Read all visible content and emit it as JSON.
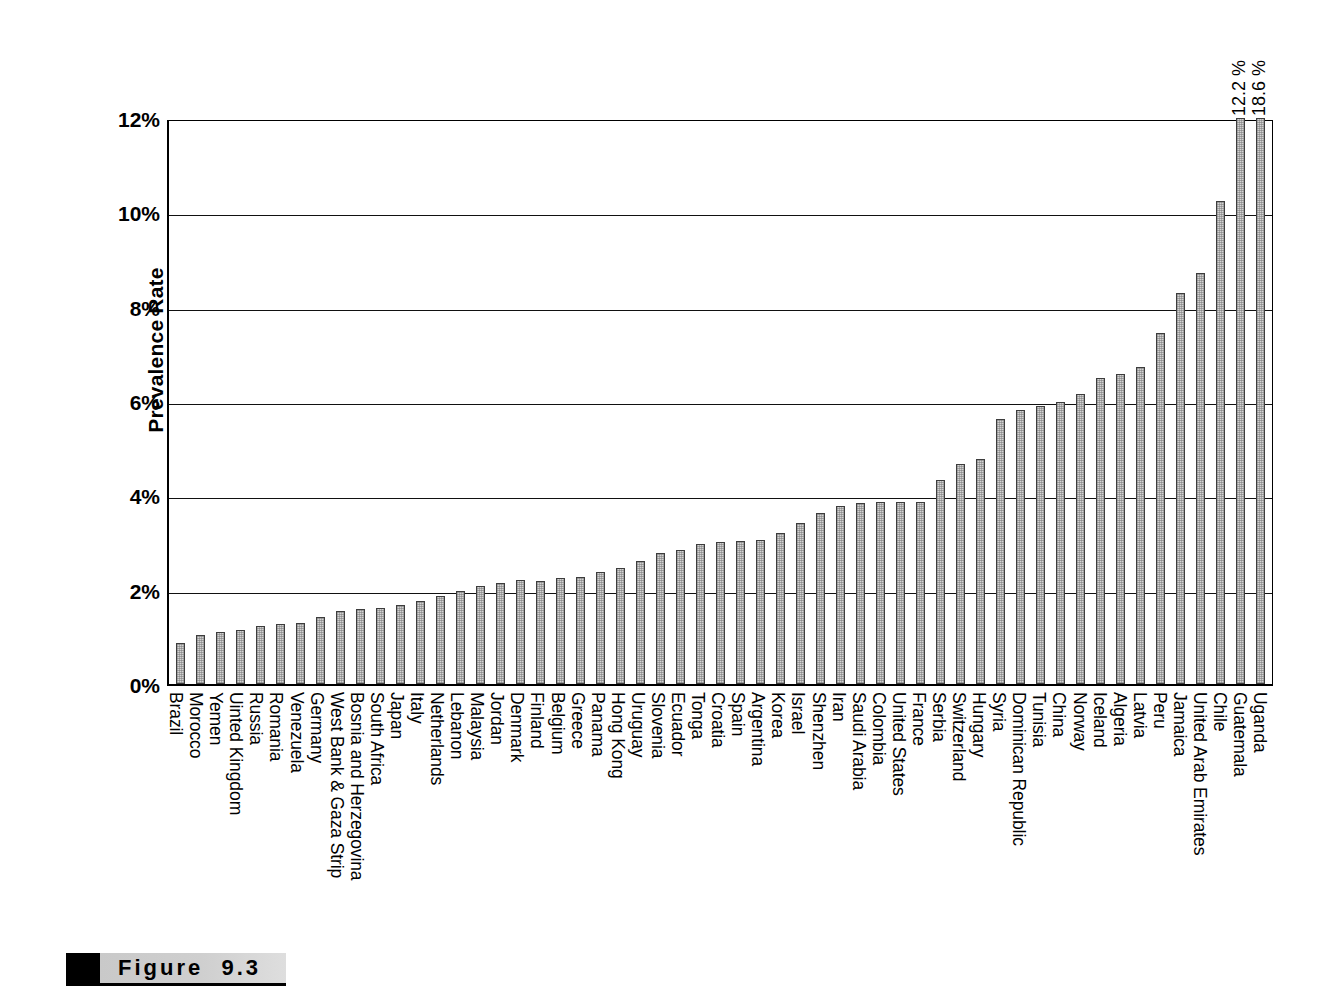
{
  "figure": {
    "caption_label": "Figure",
    "caption_number": "9.3"
  },
  "chart_data": {
    "type": "bar",
    "title": "",
    "xlabel": "",
    "ylabel": "Prevalence Rate",
    "ylim": [
      0,
      12
    ],
    "ytick_labels": [
      "0%",
      "2%",
      "4%",
      "6%",
      "8%",
      "10%",
      "12%"
    ],
    "ytick_values": [
      0,
      2,
      4,
      6,
      8,
      10,
      12
    ],
    "grid": "horizontal",
    "legend": "none",
    "unit": "%",
    "clipped_note": "Bars exceeding the 12% axis maximum are truncated and labeled with their value.",
    "categories": [
      "Brazil",
      "Morocco",
      "Yemen",
      "Uinted Kingdom",
      "Russia",
      "Romania",
      "Venezuela",
      "Germany",
      "West Bank & Gaza Strip",
      "Bosnia and Herzegovina",
      "South Africa",
      "Japan",
      "Italy",
      "Netherlands",
      "Lebanon",
      "Malaysia",
      "Jordan",
      "Denmark",
      "Finland",
      "Belgium",
      "Greece",
      "Panama",
      "Hong Kong",
      "Uruguay",
      "Slovenia",
      "Ecuador",
      "Tonga",
      "Croatia",
      "Spain",
      "Argentina",
      "Korea",
      "Israel",
      "Shenzhen",
      "Iran",
      "Saudi Arabia",
      "Colombia",
      "United States",
      "France",
      "Serbia",
      "Switzerland",
      "Hungary",
      "Syria",
      "Dominican Republic",
      "Tunisia",
      "China",
      "Norway",
      "Iceland",
      "Algeria",
      "Latvia",
      "Peru",
      "Jamaica",
      "United Arab Emirates",
      "Chile",
      "Guatemala",
      "Uganda"
    ],
    "values": [
      0.88,
      1.03,
      1.1,
      1.15,
      1.22,
      1.27,
      1.3,
      1.42,
      1.55,
      1.6,
      1.62,
      1.68,
      1.75,
      1.87,
      1.97,
      2.07,
      2.15,
      2.2,
      2.18,
      2.25,
      2.27,
      2.37,
      2.47,
      2.6,
      2.77,
      2.85,
      2.97,
      3.02,
      3.03,
      3.05,
      3.2,
      3.42,
      3.62,
      3.78,
      3.83,
      3.85,
      3.85,
      3.85,
      4.32,
      4.67,
      4.77,
      5.62,
      5.8,
      5.9,
      5.97,
      6.15,
      6.48,
      6.57,
      6.72,
      7.45,
      8.3,
      8.72,
      10.25,
      12.2,
      18.6
    ],
    "annotations": [
      {
        "category": "Guatemala",
        "text": "12.2 %"
      },
      {
        "category": "Uganda",
        "text": "18.6 %"
      }
    ]
  }
}
